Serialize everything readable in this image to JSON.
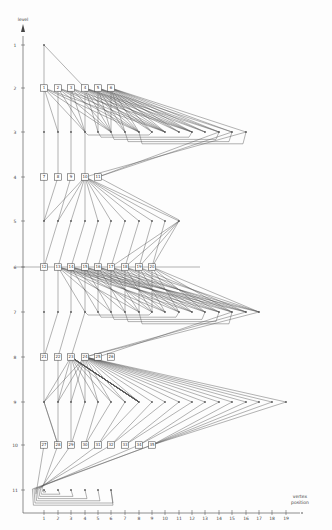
{
  "axes": {
    "y_label": "level",
    "x_label_line1": "vertex",
    "x_label_line2": "position",
    "y_ticks": [
      "1",
      "2",
      "3",
      "4",
      "5",
      "6",
      "7",
      "8",
      "9",
      "10",
      "11"
    ],
    "x_ticks": [
      "1",
      "2",
      "3",
      "4",
      "5",
      "6",
      "7",
      "8",
      "9",
      "10",
      "11",
      "12",
      "13",
      "14",
      "15",
      "16",
      "17",
      "18",
      "19"
    ]
  },
  "levels_y": [
    45,
    88,
    132,
    177,
    221,
    267,
    312,
    357,
    402,
    445,
    490
  ],
  "positions_x": [
    44,
    58,
    71,
    85,
    98,
    111,
    125,
    139,
    152,
    165,
    179,
    192,
    205,
    219,
    232,
    246,
    259,
    272,
    286
  ],
  "boxed_vertices": [
    {
      "level": 2,
      "labels": [
        "1",
        "2",
        "3",
        "4",
        "5",
        "6"
      ]
    },
    {
      "level": 4,
      "labels": [
        "7",
        "8",
        "9",
        "10",
        "11"
      ]
    },
    {
      "level": 6,
      "labels": [
        "12",
        "13",
        "14",
        "15",
        "16",
        "17",
        "18",
        "19",
        "20"
      ]
    },
    {
      "level": 8,
      "labels": [
        "21",
        "22",
        "23",
        "24",
        "25",
        "26"
      ]
    },
    {
      "level": 10,
      "labels": [
        "27",
        "28",
        "29",
        "30",
        "31",
        "32",
        "33",
        "34",
        "35"
      ]
    }
  ],
  "dot_levels": [
    {
      "level": 1,
      "count": 1
    },
    {
      "level": 3,
      "count": 16
    },
    {
      "level": 5,
      "count": 11
    },
    {
      "level": 7,
      "count": 17
    },
    {
      "level": 9,
      "count": 19
    },
    {
      "level": 11,
      "count": 6
    }
  ],
  "colors": {
    "line": "#555555",
    "box": "#333333",
    "background": "#fdfdfd"
  }
}
